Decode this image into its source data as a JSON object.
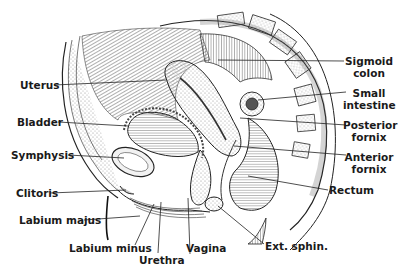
{
  "figure": {
    "colors": {
      "ink": "#1a1a1a",
      "background": "#ffffff",
      "stipple": "#9a9a9a"
    }
  },
  "labels": {
    "left": [
      {
        "id": "uterus",
        "text": "Uterus"
      },
      {
        "id": "bladder",
        "text": "Bladder"
      },
      {
        "id": "symphysis",
        "text": "Symphysis"
      },
      {
        "id": "clitoris",
        "text": "Clitoris"
      },
      {
        "id": "labium_majus",
        "text": "Labium majus"
      }
    ],
    "bottom": [
      {
        "id": "labium_minus",
        "text": "Labium minus"
      },
      {
        "id": "urethra",
        "text": "Urethra"
      },
      {
        "id": "vagina",
        "text": "Vagina"
      },
      {
        "id": "ext_sphin",
        "text": "Ext. sphin."
      }
    ],
    "right": [
      {
        "id": "sigmoid_colon",
        "line1": "Sigmoid",
        "line2": "colon"
      },
      {
        "id": "small_intestine",
        "line1": "Small",
        "line2": "intestine"
      },
      {
        "id": "posterior_fornix",
        "line1": "Posterior",
        "line2": "fornix"
      },
      {
        "id": "anterior_fornix",
        "line1": "Anterior",
        "line2": "fornix"
      },
      {
        "id": "rectum",
        "text": "Rectum"
      }
    ]
  }
}
